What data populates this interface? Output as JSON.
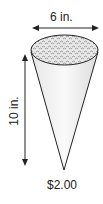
{
  "diagram": {
    "width_label": "6 in.",
    "height_label": "10 in.",
    "price_label": "$2.00",
    "colors": {
      "stroke": "#222222",
      "cone_fill": "#f2f2f2",
      "popcorn_fill": "#d9d9d9"
    }
  }
}
